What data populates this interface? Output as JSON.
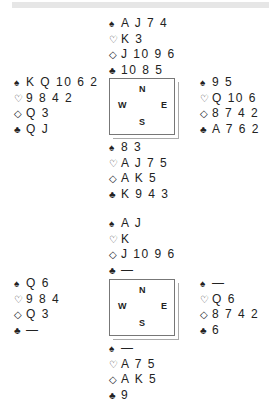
{
  "suits": {
    "spade": "♠",
    "heart": "♡",
    "diamond": "◇",
    "club": "♣"
  },
  "diagram1": {
    "north": {
      "spades": "A J 7 4",
      "hearts": "K 3",
      "diamonds": "J 10 9 6",
      "clubs": "10 8 5"
    },
    "west": {
      "spades": "K Q 10 6 2",
      "hearts": "9 8 4 2",
      "diamonds": "Q 3",
      "clubs": "Q J"
    },
    "east": {
      "spades": "9 5",
      "hearts": "Q 10 6",
      "diamonds": "8 7 4 2",
      "clubs": "A 7 6 2"
    },
    "south": {
      "spades": "8 3",
      "hearts": "A J 7 5",
      "diamonds": "A K 5",
      "clubs": "K 9 4 3"
    },
    "compass": {
      "n": "N",
      "s": "S",
      "w": "W",
      "e": "E"
    }
  },
  "diagram2": {
    "north": {
      "spades": "A J",
      "hearts": "K",
      "diamonds": "J 10 9 6",
      "clubs": "—"
    },
    "west": {
      "spades": "Q 6",
      "hearts": "9 8 4",
      "diamonds": "Q 3",
      "clubs": "—"
    },
    "east": {
      "spades": "—",
      "hearts": "Q 6",
      "diamonds": "8 7 4 2",
      "clubs": "6"
    },
    "south": {
      "spades": "—",
      "hearts": "A 7 5",
      "diamonds": "A K 5",
      "clubs": "9"
    },
    "compass": {
      "n": "N",
      "s": "S",
      "w": "W",
      "e": "E"
    }
  }
}
